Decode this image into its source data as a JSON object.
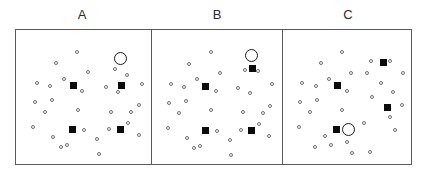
{
  "figure": {
    "title": "",
    "panel_count": 3,
    "frame": {
      "x": 15,
      "y": 29,
      "width": 397,
      "height": 136
    },
    "colors": {
      "frame_stroke": "#5a5a5a",
      "open_circle_stroke": "#6e6e6e",
      "filled_square": "#0b0b0b",
      "highlight_ring": "#1b1b1b",
      "background": "#ffffff",
      "label_text": "#2b2b2b"
    },
    "marker_legend": {
      "open_circle": "small open circle (distractor item)",
      "filled_square": "filled black square (target item)",
      "highlight_ring": "large open ring marking a selected item"
    }
  },
  "chart_data": {
    "type": "scatter",
    "title": "",
    "xlabel": "",
    "ylabel": "",
    "grid": false,
    "legend": "none",
    "xlim": [
      0,
      100
    ],
    "ylim": [
      0,
      100
    ],
    "axis_ticks": {
      "x": [],
      "y": []
    },
    "panels": [
      {
        "label": "A",
        "label_x": 82,
        "label_y": 8,
        "bounds": {
          "x": 15,
          "y": 29,
          "width": 135,
          "height": 136
        },
        "series": [
          {
            "name": "open-circles",
            "marker": "open_circle",
            "points": [
              [
                45.1,
                87.5
              ],
              [
                27.3,
                78.0
              ],
              [
                53.5,
                70.8
              ],
              [
                34.5,
                65.5
              ],
              [
                12.0,
                62.0
              ],
              [
                23.0,
                59.7
              ],
              [
                49.0,
                56.0
              ],
              [
                10.5,
                46.5
              ],
              [
                24.0,
                48.0
              ],
              [
                18.5,
                38.5
              ],
              [
                45.2,
                40.5
              ],
              [
                75.5,
                73.5
              ],
              [
                85.5,
                68.2
              ],
              [
                68.5,
                58.5
              ],
              [
                78.0,
                54.8
              ],
              [
                97.5,
                61.5
              ],
              [
                95.0,
                44.0
              ],
              [
                72.0,
                39.0
              ],
              [
                89.0,
                38.5
              ],
              [
                86.5,
                29.5
              ],
              [
                71.0,
                25.0
              ],
              [
                9.0,
                26.5
              ],
              [
                40.0,
                25.5
              ],
              [
                50.0,
                24.0
              ],
              [
                95.0,
                20.0
              ],
              [
                25.0,
                18.5
              ],
              [
                61.0,
                17.0
              ],
              [
                31.5,
                10.5
              ],
              [
                36.5,
                12.0
              ],
              [
                63.0,
                4.5
              ]
            ]
          },
          {
            "name": "filled-squares",
            "marker": "filled_square",
            "points": [
              [
                41.5,
                60.0
              ],
              [
                80.5,
                60.0
              ],
              [
                41.0,
                24.5
              ],
              [
                80.0,
                24.5
              ]
            ]
          },
          {
            "name": "highlight",
            "marker": "highlight_ring",
            "points": [
              [
                80.0,
                82.0
              ]
            ],
            "highlighted_item": "open_circle"
          }
        ]
      },
      {
        "label": "B",
        "label_x": 217,
        "label_y": 8,
        "bounds": {
          "x": 150,
          "y": 29,
          "width": 131,
          "height": 136
        },
        "series": [
          {
            "name": "open-circles",
            "marker": "open_circle",
            "points": [
              [
                45.0,
                87.0
              ],
              [
                27.0,
                77.5
              ],
              [
                53.0,
                70.5
              ],
              [
                34.0,
                65.0
              ],
              [
                12.0,
                61.5
              ],
              [
                23.0,
                59.0
              ],
              [
                49.5,
                55.5
              ],
              [
                10.5,
                46.0
              ],
              [
                24.0,
                47.5
              ],
              [
                18.5,
                38.0
              ],
              [
                45.0,
                40.0
              ],
              [
                74.0,
                72.5
              ],
              [
                85.0,
                71.5
              ],
              [
                68.0,
                58.0
              ],
              [
                78.0,
                54.0
              ],
              [
                97.0,
                61.0
              ],
              [
                95.0,
                43.5
              ],
              [
                72.0,
                38.5
              ],
              [
                89.0,
                38.0
              ],
              [
                86.0,
                29.0
              ],
              [
                70.5,
                24.5
              ],
              [
                9.0,
                26.0
              ],
              [
                40.0,
                25.0
              ],
              [
                50.0,
                23.5
              ],
              [
                94.5,
                19.5
              ],
              [
                25.0,
                18.0
              ],
              [
                61.0,
                16.5
              ],
              [
                31.0,
                10.0
              ],
              [
                36.0,
                11.5
              ],
              [
                62.5,
                4.0
              ]
            ]
          },
          {
            "name": "filled-squares",
            "marker": "filled_square",
            "points": [
              [
                41.0,
                59.5
              ],
              [
                80.0,
                74.0
              ],
              [
                41.0,
                24.0
              ],
              [
                79.5,
                24.0
              ]
            ]
          },
          {
            "name": "highlight",
            "marker": "highlight_ring",
            "points": [
              [
                79.5,
                84.0
              ]
            ],
            "highlighted_item": "open_circle"
          }
        ]
      },
      {
        "label": "C",
        "label_x": 348,
        "label_y": 8,
        "bounds": {
          "x": 281,
          "y": 29,
          "width": 131,
          "height": 136
        },
        "series": [
          {
            "name": "open-circles",
            "marker": "open_circle",
            "points": [
              [
                45.0,
                87.0
              ],
              [
                27.5,
                78.0
              ],
              [
                53.0,
                70.5
              ],
              [
                34.5,
                65.5
              ],
              [
                12.0,
                62.0
              ],
              [
                23.5,
                59.5
              ],
              [
                49.5,
                56.0
              ],
              [
                10.5,
                46.5
              ],
              [
                24.0,
                48.5
              ],
              [
                18.5,
                38.5
              ],
              [
                45.0,
                40.5
              ],
              [
                70.0,
                80.0
              ],
              [
                85.5,
                79.5
              ],
              [
                66.5,
                70.5
              ],
              [
                78.5,
                62.5
              ],
              [
                97.0,
                70.0
              ],
              [
                88.5,
                55.0
              ],
              [
                71.0,
                50.5
              ],
              [
                96.0,
                44.0
              ],
              [
                86.0,
                35.0
              ],
              [
                90.0,
                24.0
              ],
              [
                9.0,
                26.5
              ],
              [
                40.0,
                26.0
              ],
              [
                49.5,
                14.5
              ],
              [
                31.5,
                19.5
              ],
              [
                23.0,
                10.5
              ],
              [
                36.5,
                12.5
              ],
              [
                53.5,
                5.5
              ],
              [
                68.5,
                6.5
              ],
              [
                64.0,
                30.0
              ]
            ]
          },
          {
            "name": "filled-squares",
            "marker": "filled_square",
            "points": [
              [
                41.5,
                60.0
              ],
              [
                80.5,
                78.5
              ],
              [
                40.5,
                25.0
              ],
              [
                83.5,
                42.0
              ]
            ]
          },
          {
            "name": "highlight",
            "marker": "highlight_ring",
            "points": [
              [
                50.5,
                24.5
              ]
            ],
            "highlighted_item": "open_circle"
          }
        ]
      }
    ]
  }
}
